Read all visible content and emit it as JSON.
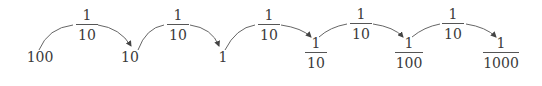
{
  "diagram": {
    "values": [
      {
        "label": "100"
      },
      {
        "label": "10"
      },
      {
        "label": "1"
      },
      {
        "numerator": "1",
        "denominator": "10"
      },
      {
        "numerator": "1",
        "denominator": "100"
      },
      {
        "numerator": "1",
        "denominator": "1000"
      }
    ],
    "steps": [
      {
        "numerator": "1",
        "denominator": "10"
      },
      {
        "numerator": "1",
        "denominator": "10"
      },
      {
        "numerator": "1",
        "denominator": "10"
      },
      {
        "numerator": "1",
        "denominator": "10"
      },
      {
        "numerator": "1",
        "denominator": "10"
      }
    ],
    "colors": {
      "text": "#3a3a3a",
      "arrow": "#555555"
    }
  }
}
